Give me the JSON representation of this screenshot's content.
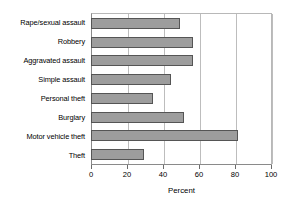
{
  "chart_data": {
    "type": "bar",
    "orientation": "horizontal",
    "title": "",
    "xlabel": "Percent",
    "ylabel": "",
    "xlim": [
      0,
      100
    ],
    "xticks": [
      0,
      20,
      40,
      60,
      80,
      100
    ],
    "xtick_labels": [
      "0",
      "20",
      "40",
      "60",
      "80",
      "100"
    ],
    "grid": "vertical",
    "legend": "none",
    "categories": [
      "Rape/sexual assault",
      "Robbery",
      "Aggravated assault",
      "Simple assault",
      "Personal theft",
      "Burglary",
      "Motor vehicle theft",
      "Theft"
    ],
    "values": [
      49,
      56,
      56,
      44,
      34,
      51,
      81,
      29
    ],
    "bar_color": "#9d9d9d",
    "bar_edge_color": "#555555",
    "grid_color": "#bdbdbd",
    "axis_color": "#8a8a8a"
  }
}
